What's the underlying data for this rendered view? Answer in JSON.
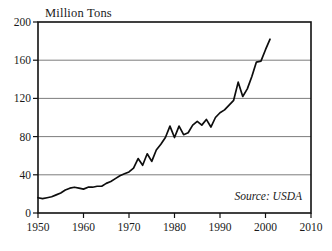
{
  "chart_data": {
    "type": "line",
    "title": "Million Tons",
    "xlabel": "",
    "ylabel": "",
    "ylim": [
      0,
      200
    ],
    "xlim": [
      1950,
      2010
    ],
    "yticks": [
      0,
      40,
      80,
      120,
      160,
      200
    ],
    "xticks": [
      1950,
      1960,
      1970,
      1980,
      1990,
      2000,
      2010
    ],
    "grid": "horizontal",
    "legend": "none",
    "annotation": "Source: USDA",
    "series": [
      {
        "name": "Production",
        "color": "#0d0d0d",
        "x": [
          1950,
          1951,
          1952,
          1953,
          1954,
          1955,
          1956,
          1957,
          1958,
          1959,
          1960,
          1961,
          1962,
          1963,
          1964,
          1965,
          1966,
          1967,
          1968,
          1969,
          1970,
          1971,
          1972,
          1973,
          1974,
          1975,
          1976,
          1977,
          1978,
          1979,
          1980,
          1981,
          1982,
          1983,
          1984,
          1985,
          1986,
          1987,
          1988,
          1989,
          1990,
          1991,
          1992,
          1993,
          1994,
          1995,
          1996,
          1997,
          1998,
          1999,
          2000,
          2001
        ],
        "values": [
          16,
          15,
          16,
          17,
          19,
          21,
          24,
          26,
          27,
          26,
          25,
          27,
          27,
          28,
          28,
          31,
          33,
          36,
          39,
          41,
          43,
          47,
          57,
          50,
          62,
          54,
          66,
          72,
          79,
          91,
          79,
          91,
          82,
          84,
          92,
          96,
          92,
          98,
          90,
          100,
          105,
          108,
          113,
          118,
          137,
          122,
          130,
          143,
          158,
          159,
          171,
          182
        ]
      }
    ]
  }
}
